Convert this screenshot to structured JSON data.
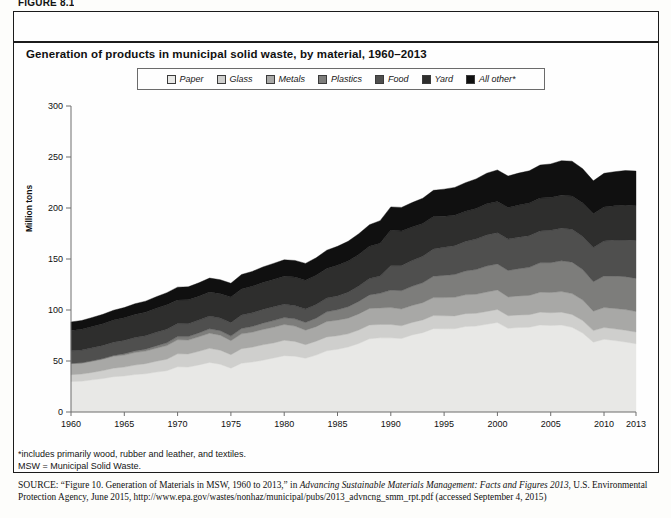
{
  "figure_label": "FIGURE 8.1",
  "chart_title": "Generation of products in municipal solid waste, by material, 1960–2013",
  "legend": {
    "items": [
      {
        "label": "Paper",
        "color": "#e8e8e6"
      },
      {
        "label": "Glass",
        "color": "#cfcfcd"
      },
      {
        "label": "Metals",
        "color": "#a8a8a6"
      },
      {
        "label": "Plastics",
        "color": "#7d7d7b"
      },
      {
        "label": "Food",
        "color": "#4f4f4e"
      },
      {
        "label": "Yard",
        "color": "#2e2e2d"
      },
      {
        "label": "All other*",
        "color": "#101010"
      }
    ]
  },
  "notes": {
    "footnote": "*includes primarily wood, rubber and leather, and textiles.",
    "abbrev": "MSW = Municipal Solid Waste."
  },
  "source": {
    "label": "SOURCE:",
    "part1": " “Figure 10. Generation of Materials in MSW, 1960 to 2013,” in ",
    "italic": "Advancing Sustainable Materials Management: Facts and Figures 2013",
    "part2": ", U.S. Environmental Protection Agency, June 2015, http://www.epa.gov/wastes/nonhaz/municipal/pubs/2013_advncng_smm_rpt.pdf (accessed September 4, 2015)"
  },
  "chart_data": {
    "type": "area",
    "stacked": true,
    "title": "Generation of products in municipal solid waste, by material, 1960–2013",
    "xlabel": "",
    "ylabel": "Million tons",
    "ylim": [
      0,
      300
    ],
    "yticks": [
      0,
      50,
      100,
      150,
      200,
      250,
      300
    ],
    "xlim": [
      1960,
      2013
    ],
    "xticks": [
      1960,
      1965,
      1970,
      1975,
      1980,
      1985,
      1990,
      1995,
      2000,
      2005,
      2010,
      2013
    ],
    "grid": false,
    "legend_position": "top",
    "units": "million tons",
    "x": [
      1960,
      1961,
      1962,
      1963,
      1964,
      1965,
      1966,
      1967,
      1968,
      1969,
      1970,
      1971,
      1972,
      1973,
      1974,
      1975,
      1976,
      1977,
      1978,
      1979,
      1980,
      1981,
      1982,
      1983,
      1984,
      1985,
      1986,
      1987,
      1988,
      1989,
      1990,
      1991,
      1992,
      1993,
      1994,
      1995,
      1996,
      1997,
      1998,
      1999,
      2000,
      2001,
      2002,
      2003,
      2004,
      2005,
      2006,
      2007,
      2008,
      2009,
      2010,
      2011,
      2012,
      2013
    ],
    "series": [
      {
        "name": "Paper",
        "color": "#e8e8e6",
        "values": [
          29.9,
          30.2,
          31.5,
          32.8,
          34.6,
          35.3,
          36.7,
          37.5,
          39.1,
          40.5,
          44.3,
          44.0,
          46.2,
          48.6,
          46.8,
          43.0,
          47.8,
          49.0,
          50.8,
          52.9,
          55.2,
          54.7,
          52.7,
          55.8,
          60.0,
          61.5,
          63.7,
          67.2,
          71.8,
          72.7,
          72.7,
          72.0,
          75.6,
          77.8,
          81.7,
          81.5,
          81.6,
          83.8,
          84.2,
          86.0,
          87.7,
          82.0,
          82.8,
          83.1,
          85.3,
          84.8,
          85.3,
          83.0,
          77.4,
          68.4,
          71.3,
          70.0,
          68.6,
          66.9
        ]
      },
      {
        "name": "Glass",
        "color": "#cfcfcd",
        "values": [
          6.7,
          7.0,
          7.3,
          7.8,
          8.4,
          8.7,
          9.3,
          9.9,
          10.6,
          11.3,
          12.7,
          12.9,
          13.3,
          13.8,
          13.8,
          13.2,
          14.3,
          14.6,
          15.1,
          14.8,
          15.1,
          14.5,
          13.3,
          13.6,
          13.6,
          13.2,
          12.9,
          13.2,
          13.5,
          13.1,
          13.1,
          12.5,
          12.2,
          12.5,
          12.8,
          12.8,
          12.6,
          12.6,
          12.5,
          12.6,
          12.8,
          12.4,
          12.3,
          12.3,
          12.6,
          12.5,
          12.6,
          12.6,
          12.2,
          11.4,
          11.5,
          11.5,
          11.6,
          11.5
        ]
      },
      {
        "name": "Metals",
        "color": "#a8a8a6",
        "values": [
          10.8,
          10.6,
          10.9,
          11.2,
          11.6,
          11.8,
          12.3,
          12.3,
          12.8,
          13.3,
          13.8,
          13.6,
          14.2,
          14.8,
          14.7,
          13.7,
          14.5,
          14.6,
          15.0,
          15.3,
          15.5,
          15.0,
          14.2,
          14.3,
          15.1,
          15.3,
          15.4,
          15.8,
          16.2,
          16.2,
          16.6,
          16.5,
          16.6,
          16.9,
          17.7,
          17.9,
          18.2,
          18.5,
          18.7,
          19.0,
          19.1,
          18.4,
          18.7,
          18.9,
          19.5,
          19.8,
          20.2,
          20.5,
          20.2,
          19.0,
          19.6,
          20.0,
          20.2,
          20.1
        ]
      },
      {
        "name": "Plastics",
        "color": "#7d7d7b",
        "values": [
          0.4,
          0.5,
          0.6,
          0.7,
          0.9,
          1.4,
          1.6,
          1.9,
          2.3,
          2.7,
          3.1,
          3.4,
          3.8,
          4.3,
          4.4,
          4.5,
          5.2,
          5.6,
          6.2,
          6.6,
          6.8,
          7.1,
          7.5,
          8.3,
          9.5,
          10.2,
          11.2,
          12.2,
          13.3,
          14.3,
          17.1,
          17.9,
          18.8,
          19.5,
          20.9,
          21.7,
          22.4,
          23.3,
          24.3,
          25.5,
          25.5,
          25.9,
          26.7,
          27.5,
          28.9,
          29.3,
          30.1,
          30.8,
          29.8,
          28.9,
          31.0,
          31.8,
          32.3,
          32.5
        ]
      },
      {
        "name": "Food",
        "color": "#4f4f4e",
        "values": [
          12.2,
          12.4,
          12.6,
          12.8,
          12.9,
          13.0,
          13.1,
          13.2,
          13.3,
          13.4,
          12.8,
          12.7,
          12.6,
          12.5,
          12.4,
          13.2,
          13.3,
          13.4,
          13.5,
          13.6,
          13.0,
          13.1,
          13.2,
          13.4,
          13.5,
          13.6,
          14.3,
          15.1,
          16.0,
          17.0,
          23.9,
          24.6,
          25.3,
          26.0,
          26.8,
          27.5,
          28.3,
          29.0,
          29.8,
          30.5,
          30.7,
          30.8,
          30.9,
          31.1,
          31.2,
          31.7,
          32.0,
          32.2,
          32.4,
          33.5,
          34.2,
          35.3,
          36.0,
          37.1
        ]
      },
      {
        "name": "Yard",
        "color": "#2e2e2d",
        "values": [
          20.0,
          20.4,
          20.9,
          21.3,
          21.8,
          22.2,
          22.7,
          23.1,
          23.6,
          24.0,
          23.2,
          23.4,
          23.5,
          23.7,
          23.9,
          25.2,
          25.6,
          26.0,
          26.4,
          26.8,
          27.5,
          27.9,
          28.3,
          28.7,
          29.1,
          30.0,
          30.5,
          31.0,
          31.6,
          32.2,
          35.0,
          33.9,
          32.8,
          32.1,
          31.7,
          30.6,
          29.8,
          29.5,
          30.0,
          30.5,
          30.5,
          31.0,
          31.5,
          31.9,
          32.2,
          32.1,
          32.4,
          32.6,
          32.9,
          33.2,
          33.4,
          33.6,
          34.2,
          34.2
        ]
      },
      {
        "name": "All other*",
        "color": "#101010",
        "values": [
          8.3,
          8.6,
          8.9,
          9.2,
          9.6,
          10.0,
          10.4,
          10.8,
          11.3,
          11.8,
          12.5,
          12.7,
          13.1,
          13.6,
          13.7,
          13.4,
          14.1,
          14.6,
          15.2,
          15.7,
          16.1,
          16.3,
          16.5,
          17.1,
          17.9,
          18.6,
          19.4,
          20.3,
          21.2,
          22.1,
          22.7,
          23.2,
          24.0,
          24.8,
          25.7,
          26.5,
          27.3,
          28.1,
          29.0,
          30.0,
          31.0,
          30.8,
          31.3,
          31.7,
          32.4,
          33.0,
          33.8,
          34.2,
          33.6,
          32.2,
          33.0,
          33.4,
          33.8,
          33.9
        ]
      }
    ]
  }
}
